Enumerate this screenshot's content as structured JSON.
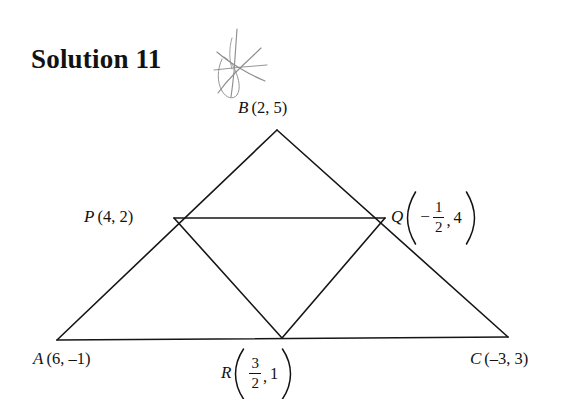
{
  "title": {
    "text": "Solution 11"
  },
  "annotation": {
    "scribble_name": "pencil-star-scribble",
    "color": "#8f8f8f"
  },
  "figure": {
    "stroke_color": "#161616",
    "stroke_width": 1.6,
    "background": "#ffffff",
    "vertices": {
      "A": {
        "x": 57,
        "y": 340
      },
      "B": {
        "x": 277,
        "y": 130
      },
      "C": {
        "x": 508,
        "y": 337
      },
      "P": {
        "x": 174,
        "y": 218
      },
      "Q": {
        "x": 385,
        "y": 218
      },
      "R": {
        "x": 282,
        "y": 338
      }
    },
    "edges": [
      {
        "name": "side-AB",
        "from": "A",
        "to": "B"
      },
      {
        "name": "side-BC",
        "from": "B",
        "to": "C"
      },
      {
        "name": "side-CA",
        "from": "C",
        "to": "A"
      },
      {
        "name": "midsegment-PQ",
        "from": "P",
        "to": "Q"
      },
      {
        "name": "midsegment-QR",
        "from": "Q",
        "to": "R"
      },
      {
        "name": "midsegment-RP",
        "from": "R",
        "to": "P"
      }
    ]
  },
  "labels": {
    "B": {
      "point": "B",
      "coords": "(2, 5)"
    },
    "P": {
      "point": "P",
      "coords": "(4, 2)"
    },
    "A": {
      "point": "A",
      "coords": "(6, –1)"
    },
    "C": {
      "point": "C",
      "coords": "(–3, 3)"
    },
    "Q": {
      "point": "Q",
      "x_sign": "−",
      "x_numerator": "1",
      "x_denominator": "2",
      "comma": ",",
      "y": "4"
    },
    "R": {
      "point": "R",
      "x_numerator": "3",
      "x_denominator": "2",
      "comma": ",",
      "y": "1"
    }
  }
}
